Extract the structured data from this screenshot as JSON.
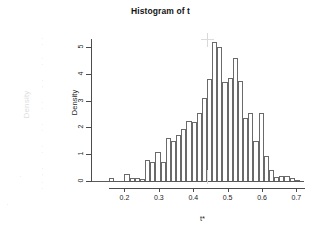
{
  "chart_data": {
    "type": "bar",
    "title": "Histogram of t",
    "xlabel": "t*",
    "ylabel": "Density",
    "xlim": [
      0.155,
      0.725
    ],
    "ylim": [
      0,
      5.3
    ],
    "grid": false,
    "legend": null,
    "bin_width": 0.015,
    "x_ticks": [
      0.2,
      0.3,
      0.4,
      0.5,
      0.6,
      0.7
    ],
    "x_tick_labels": [
      "0.2",
      "0.3",
      "0.4",
      "0.5",
      "0.6",
      "0.7"
    ],
    "y_ticks": [
      0,
      1,
      2,
      3,
      4,
      5
    ],
    "y_tick_labels": [
      "0",
      "1",
      "2",
      "3",
      "4",
      "5"
    ],
    "bin_centers": [
      0.1625,
      0.1775,
      0.1925,
      0.2075,
      0.2225,
      0.2375,
      0.2525,
      0.2675,
      0.2825,
      0.2975,
      0.3125,
      0.3275,
      0.3425,
      0.3575,
      0.3725,
      0.3875,
      0.4025,
      0.4175,
      0.4325,
      0.4475,
      0.4625,
      0.4775,
      0.4925,
      0.5075,
      0.5225,
      0.5375,
      0.5525,
      0.5675,
      0.5825,
      0.5975,
      0.6125,
      0.6275,
      0.6425,
      0.6575,
      0.6725,
      0.6875,
      0.7025
    ],
    "values": [
      0.1,
      0.0,
      0.0,
      0.25,
      0.12,
      0.1,
      0.08,
      0.78,
      0.72,
      1.08,
      0.7,
      1.6,
      1.5,
      1.7,
      1.95,
      2.25,
      2.2,
      2.55,
      3.1,
      3.8,
      5.2,
      5.0,
      3.7,
      3.85,
      4.6,
      3.75,
      2.35,
      2.55,
      1.5,
      2.55,
      0.95,
      0.42,
      0.15,
      0.2,
      0.18,
      0.1,
      0.05
    ]
  },
  "artifacts": {
    "ghost_ylabel": "Density",
    "ghost_tick_labels": [
      "",
      "",
      "",
      "",
      "",
      "",
      "",
      "",
      "",
      "",
      "",
      ""
    ]
  }
}
